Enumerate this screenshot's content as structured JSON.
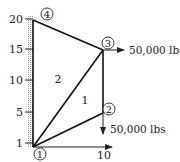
{
  "diagram": {
    "type": "truss",
    "y_axis": {
      "ticks": [
        {
          "label": "20",
          "y": 19
        },
        {
          "label": "15",
          "y": 49
        },
        {
          "label": "10",
          "y": 80
        },
        {
          "label": "5",
          "y": 112
        },
        {
          "label": "1",
          "y": 143
        }
      ]
    },
    "x_axis": {
      "tick_label": "10"
    },
    "nodes": [
      {
        "id": "1",
        "label": "1"
      },
      {
        "id": "2",
        "label": "2"
      },
      {
        "id": "3",
        "label": "3"
      },
      {
        "id": "4",
        "label": "4"
      }
    ],
    "elements": [
      {
        "id": "1",
        "label": "1"
      },
      {
        "id": "2",
        "label": "2"
      }
    ],
    "loads": [
      {
        "node": "3",
        "direction": "right",
        "label": "50,000 lbs"
      },
      {
        "node": "2",
        "direction": "down",
        "label": "50,000 lbs"
      }
    ]
  }
}
